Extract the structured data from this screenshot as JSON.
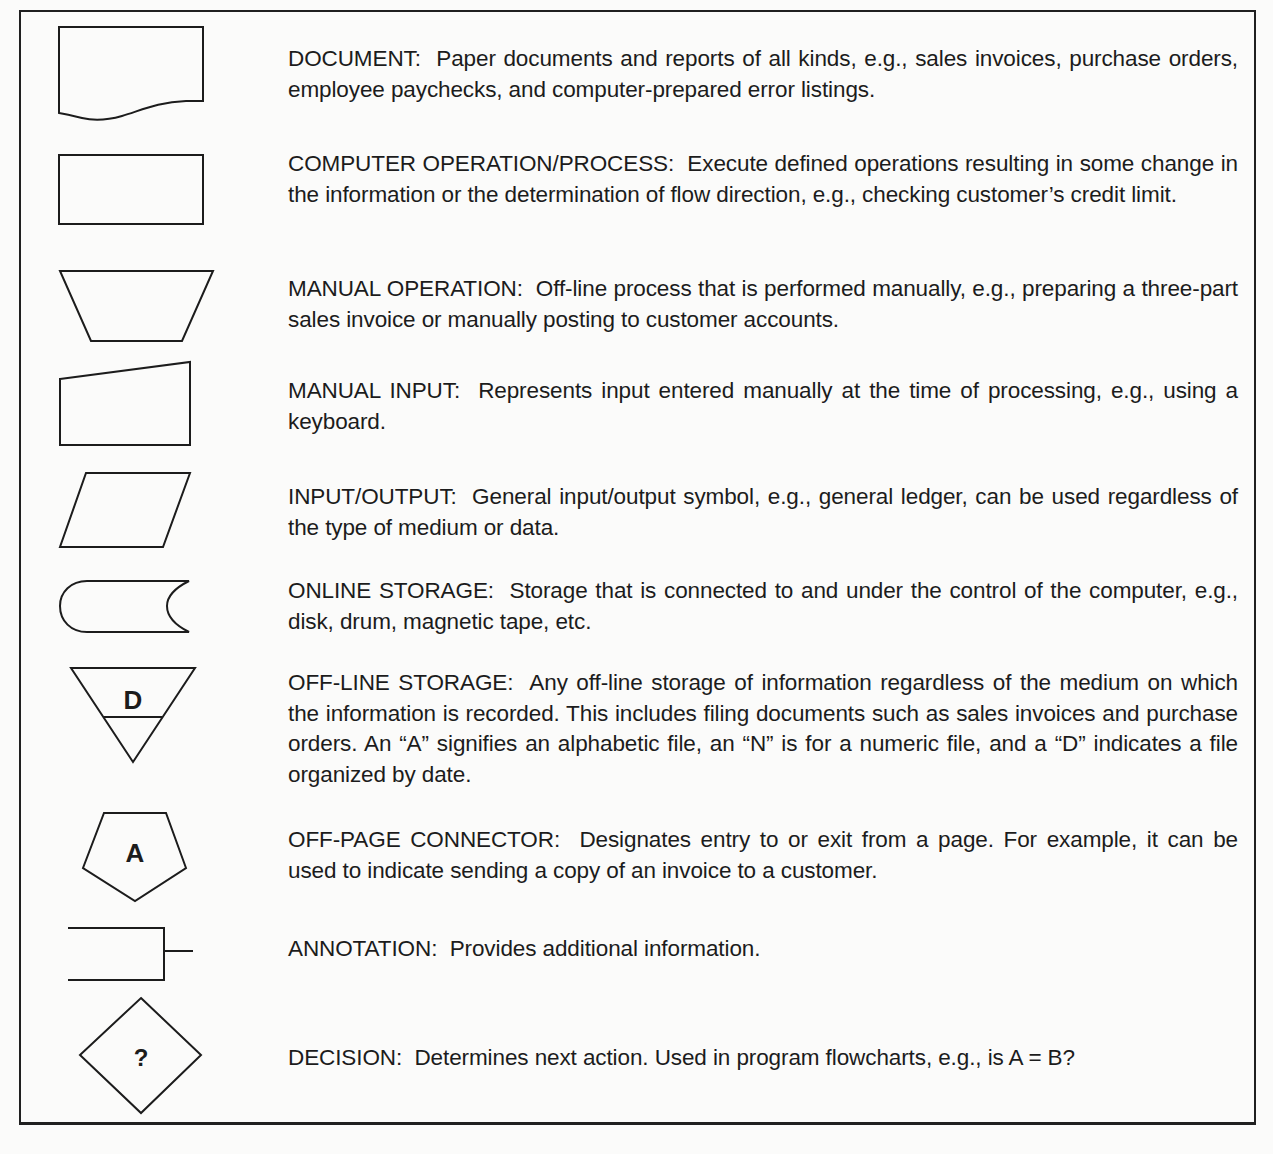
{
  "legend": {
    "items": [
      {
        "symbol": "document",
        "term": "DOCUMENT:",
        "description": "Paper documents and reports of all kinds, e.g., sales invoices, purchase orders, employee paychecks, and computer-prepared error listings."
      },
      {
        "symbol": "process",
        "term": "COMPUTER OPERATION/PROCESS:",
        "description": "Execute defined operations resulting in some change in the information or the determination of flow direction, e.g., checking customer’s credit limit."
      },
      {
        "symbol": "manual-operation",
        "term": "MANUAL OPERATION:",
        "description": "Off-line process that is performed manually, e.g., preparing a three-part sales invoice or manually posting to customer accounts."
      },
      {
        "symbol": "manual-input",
        "term": "MANUAL INPUT:",
        "description": "Represents input entered manually at the time of processing, e.g., using a keyboard."
      },
      {
        "symbol": "input-output",
        "term": "INPUT/OUTPUT:",
        "description": "General input/output symbol, e.g., general ledger, can be used regardless of the type of medium or data."
      },
      {
        "symbol": "online-storage",
        "term": "ONLINE STORAGE:",
        "description": "Storage that is connected to and under the control of the computer, e.g., disk, drum, magnetic tape, etc."
      },
      {
        "symbol": "offline-storage",
        "term": "OFF-LINE STORAGE:",
        "description": "Any off-line storage of information regardless of the medium on which the information is recorded. This includes filing documents such as sales invoices and purchase orders. An “A” signifies an alphabetic file, an “N” is for a numeric file, and a “D” indicates a file organized by date.",
        "glyph": "D"
      },
      {
        "symbol": "off-page-connector",
        "term": "OFF-PAGE CONNECTOR:",
        "description": "Designates entry to or exit from a page. For example, it can be used to indicate sending a copy of an invoice to a customer.",
        "glyph": "A"
      },
      {
        "symbol": "annotation",
        "term": "ANNOTATION:",
        "description": "Provides additional information."
      },
      {
        "symbol": "decision",
        "term": "DECISION:",
        "description": "Determines next action. Used in program flowcharts, e.g., is A = B?",
        "glyph": "?"
      }
    ]
  },
  "colors": {
    "ink": "#1c1c1c",
    "paper": "#fbfbfa"
  }
}
